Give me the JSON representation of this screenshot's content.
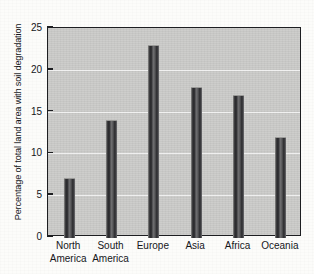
{
  "chart_data": {
    "type": "bar",
    "title": "",
    "xlabel": "",
    "ylabel": "Percentage of total land area with soil degradation",
    "categories": [
      "North America",
      "South America",
      "Europe",
      "Asia",
      "Africa",
      "Oceania"
    ],
    "category_lines": [
      [
        "North",
        "America"
      ],
      [
        "South",
        "America"
      ],
      [
        "Europe",
        ""
      ],
      [
        "Asia",
        ""
      ],
      [
        "Africa",
        ""
      ],
      [
        "Oceania",
        ""
      ]
    ],
    "values": [
      7,
      14,
      23,
      18,
      17,
      12
    ],
    "ylim": [
      0,
      25
    ],
    "ytick_labels": [
      "0",
      "5",
      "10",
      "15",
      "20",
      "25"
    ],
    "yticks": [
      0,
      5,
      10,
      15,
      20,
      25
    ],
    "gridlines": [
      5,
      10,
      15,
      20
    ],
    "grid": true,
    "legend": "none",
    "colors": {
      "plot_background": "#c9c9c7",
      "page_background": "#fcfcfa",
      "bar_dark": "#242427",
      "bar_light": "#8e8e8c",
      "axis": "#1d1e21",
      "gridline": "#ffffff",
      "text": "#15161a"
    }
  }
}
